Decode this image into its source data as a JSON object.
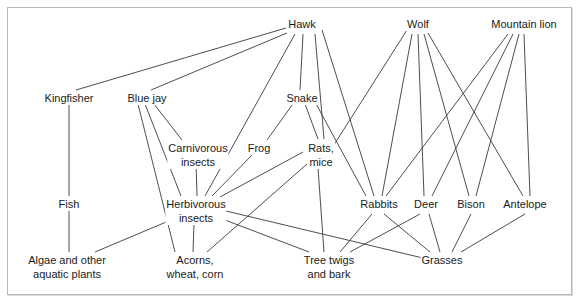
{
  "diagram": {
    "type": "food-web",
    "colors": {
      "line": "#3a3a3a",
      "text": "#1a1a1a",
      "border": "#b8b8b8",
      "background": "#ffffff"
    },
    "nodes": [
      {
        "id": "hawk",
        "label": "Hawk",
        "x": 302,
        "y": 24
      },
      {
        "id": "wolf",
        "label": "Wolf",
        "x": 418,
        "y": 24
      },
      {
        "id": "mountain_lion",
        "label": "Mountain lion",
        "x": 524,
        "y": 24
      },
      {
        "id": "kingfisher",
        "label": "Kingfisher",
        "x": 69,
        "y": 94
      },
      {
        "id": "blue_jay",
        "label": "Blue jay",
        "x": 148,
        "y": 94
      },
      {
        "id": "snake",
        "label": "Snake",
        "x": 302,
        "y": 94
      },
      {
        "id": "carnivorous_insects",
        "label": "Carnivorous insects",
        "line1": "Carnivorous",
        "line2": "insects",
        "x": 198,
        "y": 144
      },
      {
        "id": "frog",
        "label": "Frog",
        "x": 259,
        "y": 144
      },
      {
        "id": "rats_mice",
        "label": "Rats, mice",
        "line1": "Rats,",
        "line2": "mice",
        "x": 321,
        "y": 144
      },
      {
        "id": "fish",
        "label": "Fish",
        "x": 69,
        "y": 200
      },
      {
        "id": "herbivorous_insects",
        "label": "Herbivorous insects",
        "line1": "Herbivorous",
        "line2": "insects",
        "x": 196,
        "y": 200
      },
      {
        "id": "rabbits",
        "label": "Rabbits",
        "x": 378,
        "y": 200
      },
      {
        "id": "deer",
        "label": "Deer",
        "x": 426,
        "y": 200
      },
      {
        "id": "bison",
        "label": "Bison",
        "x": 471,
        "y": 200
      },
      {
        "id": "antelope",
        "label": "Antelope",
        "x": 525,
        "y": 200
      },
      {
        "id": "algae",
        "label": "Algae and other aquatic plants",
        "line1": "Algae and other",
        "line2": "aquatic plants",
        "x": 67,
        "y": 256
      },
      {
        "id": "acorns",
        "label": "Acorns, wheat, corn",
        "line1": "Acorns,",
        "line2": "wheat, corn",
        "x": 195,
        "y": 256
      },
      {
        "id": "tree_twigs",
        "label": "Tree twigs and bark",
        "line1": "Tree twigs",
        "line2": "and bark",
        "x": 329,
        "y": 256
      },
      {
        "id": "grasses",
        "label": "Grasses",
        "x": 442,
        "y": 256
      }
    ],
    "edges": [
      {
        "from": "hawk",
        "to": "kingfisher",
        "x1": 286,
        "y1": 28,
        "x2": 76,
        "y2": 90
      },
      {
        "from": "hawk",
        "to": "blue_jay",
        "x1": 287,
        "y1": 33,
        "x2": 151,
        "y2": 90
      },
      {
        "from": "hawk",
        "to": "herbivorous_insects",
        "x1": 295,
        "y1": 34,
        "x2": 205,
        "y2": 196
      },
      {
        "from": "hawk",
        "to": "snake",
        "x1": 303,
        "y1": 34,
        "x2": 300,
        "y2": 90
      },
      {
        "from": "hawk",
        "to": "rats_mice",
        "x1": 315,
        "y1": 34,
        "x2": 324,
        "y2": 139
      },
      {
        "from": "hawk",
        "to": "rabbits",
        "x1": 322,
        "y1": 30,
        "x2": 374,
        "y2": 196
      },
      {
        "from": "wolf",
        "to": "rats_mice",
        "x1": 407,
        "y1": 30,
        "x2": 332,
        "y2": 148
      },
      {
        "from": "wolf",
        "to": "rabbits",
        "x1": 412,
        "y1": 34,
        "x2": 382,
        "y2": 196
      },
      {
        "from": "wolf",
        "to": "deer",
        "x1": 418,
        "y1": 34,
        "x2": 424,
        "y2": 196
      },
      {
        "from": "wolf",
        "to": "bison",
        "x1": 424,
        "y1": 34,
        "x2": 469,
        "y2": 196
      },
      {
        "from": "wolf",
        "to": "antelope",
        "x1": 428,
        "y1": 33,
        "x2": 523,
        "y2": 196
      },
      {
        "from": "mountain_lion",
        "to": "rabbits",
        "x1": 508,
        "y1": 34,
        "x2": 386,
        "y2": 196
      },
      {
        "from": "mountain_lion",
        "to": "deer",
        "x1": 513,
        "y1": 34,
        "x2": 432,
        "y2": 196
      },
      {
        "from": "mountain_lion",
        "to": "bison",
        "x1": 519,
        "y1": 34,
        "x2": 476,
        "y2": 196
      },
      {
        "from": "mountain_lion",
        "to": "antelope",
        "x1": 524,
        "y1": 34,
        "x2": 530,
        "y2": 196
      },
      {
        "from": "kingfisher",
        "to": "fish",
        "x1": 69,
        "y1": 104,
        "x2": 69,
        "y2": 196
      },
      {
        "from": "blue_jay",
        "to": "carnivorous_insects",
        "x1": 154,
        "y1": 104,
        "x2": 182,
        "y2": 140
      },
      {
        "from": "blue_jay",
        "to": "herbivorous_insects",
        "x1": 145,
        "y1": 104,
        "x2": 181,
        "y2": 196
      },
      {
        "from": "blue_jay",
        "to": "acorns",
        "x1": 138,
        "y1": 104,
        "x2": 175,
        "y2": 252
      },
      {
        "from": "snake",
        "to": "frog",
        "x1": 295,
        "y1": 101,
        "x2": 267,
        "y2": 140
      },
      {
        "from": "snake",
        "to": "rats_mice",
        "x1": 305,
        "y1": 104,
        "x2": 318,
        "y2": 139
      },
      {
        "from": "snake",
        "to": "rabbits",
        "x1": 314,
        "y1": 100,
        "x2": 366,
        "y2": 196
      },
      {
        "from": "carnivorous_insects",
        "to": "herbivorous_insects",
        "x1": 196,
        "y1": 162,
        "x2": 197,
        "y2": 196
      },
      {
        "from": "frog",
        "to": "herbivorous_insects",
        "x1": 254,
        "y1": 153,
        "x2": 212,
        "y2": 196
      },
      {
        "from": "rats_mice",
        "to": "herbivorous_insects",
        "x1": 303,
        "y1": 152,
        "x2": 220,
        "y2": 197
      },
      {
        "from": "rats_mice",
        "to": "acorns",
        "x1": 307,
        "y1": 164,
        "x2": 207,
        "y2": 252
      },
      {
        "from": "rats_mice",
        "to": "tree_twigs",
        "x1": 318,
        "y1": 168,
        "x2": 324,
        "y2": 252
      },
      {
        "from": "fish",
        "to": "algae",
        "x1": 69,
        "y1": 210,
        "x2": 69,
        "y2": 252
      },
      {
        "from": "herbivorous_insects",
        "to": "algae",
        "x1": 178,
        "y1": 217,
        "x2": 95,
        "y2": 252
      },
      {
        "from": "herbivorous_insects",
        "to": "acorns",
        "x1": 194,
        "y1": 224,
        "x2": 193,
        "y2": 252
      },
      {
        "from": "herbivorous_insects",
        "to": "tree_twigs",
        "x1": 217,
        "y1": 217,
        "x2": 309,
        "y2": 252
      },
      {
        "from": "herbivorous_insects",
        "to": "grasses",
        "x1": 226,
        "y1": 211,
        "x2": 427,
        "y2": 259
      },
      {
        "from": "rabbits",
        "to": "tree_twigs",
        "x1": 372,
        "y1": 214,
        "x2": 340,
        "y2": 252
      },
      {
        "from": "rabbits",
        "to": "grasses",
        "x1": 384,
        "y1": 214,
        "x2": 430,
        "y2": 252
      },
      {
        "from": "deer",
        "to": "tree_twigs",
        "x1": 420,
        "y1": 214,
        "x2": 350,
        "y2": 252
      },
      {
        "from": "deer",
        "to": "grasses",
        "x1": 429,
        "y1": 214,
        "x2": 440,
        "y2": 252
      },
      {
        "from": "bison",
        "to": "grasses",
        "x1": 471,
        "y1": 214,
        "x2": 452,
        "y2": 252
      },
      {
        "from": "antelope",
        "to": "grasses",
        "x1": 525,
        "y1": 214,
        "x2": 461,
        "y2": 252
      }
    ]
  },
  "labels": {
    "hawk": "Hawk",
    "wolf": "Wolf",
    "mountain_lion": "Mountain lion",
    "kingfisher": "Kingfisher",
    "blue_jay": "Blue jay",
    "snake": "Snake",
    "carnivorous_insects_1": "Carnivorous",
    "carnivorous_insects_2": "insects",
    "frog": "Frog",
    "rats_mice_1": "Rats,",
    "rats_mice_2": "mice",
    "fish": "Fish",
    "herbivorous_insects_1": "Herbivorous",
    "herbivorous_insects_2": "insects",
    "rabbits": "Rabbits",
    "deer": "Deer",
    "bison": "Bison",
    "antelope": "Antelope",
    "algae_1": "Algae and other",
    "algae_2": "aquatic plants",
    "acorns_1": "Acorns,",
    "acorns_2": "wheat, corn",
    "tree_twigs_1": "Tree twigs",
    "tree_twigs_2": "and bark",
    "grasses": "Grasses"
  }
}
